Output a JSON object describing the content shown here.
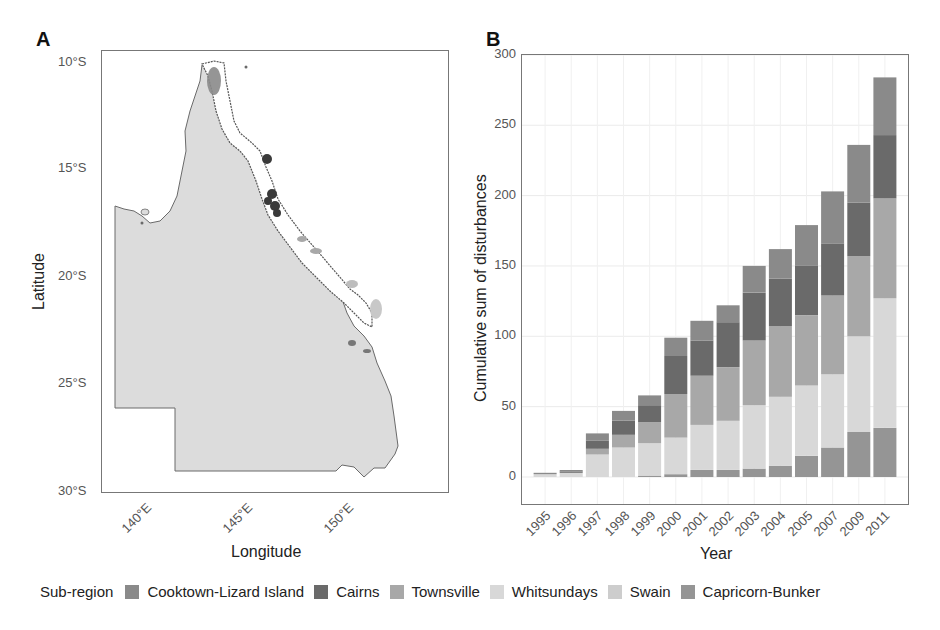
{
  "panels": {
    "a": {
      "label": "A",
      "xlabel": "Longitude",
      "ylabel": "Latitude",
      "yticks": [
        "10°S",
        "15°S",
        "20°S",
        "25°S",
        "30°S"
      ],
      "xticks": [
        "140°E",
        "145°E",
        "150°E"
      ]
    },
    "b": {
      "label": "B"
    }
  },
  "legend": {
    "title": "Sub-region",
    "items": [
      {
        "label": "Cooktown-Lizard Island",
        "color": "#8a8a8a"
      },
      {
        "label": "Cairns",
        "color": "#6a6a6a"
      },
      {
        "label": "Townsville",
        "color": "#a8a8a8"
      },
      {
        "label": "Whitsundays",
        "color": "#d8d8d8"
      },
      {
        "label": "Swain",
        "color": "#cdcdcd"
      },
      {
        "label": "Capricorn-Bunker",
        "color": "#959595"
      }
    ]
  },
  "chart_data": {
    "type": "bar",
    "stacked": true,
    "title": "",
    "xlabel": "Year",
    "ylabel": "Cumulative sum of disturbances",
    "ylim": [
      0,
      300
    ],
    "yticks": [
      0,
      50,
      100,
      150,
      200,
      250,
      300
    ],
    "grid": true,
    "legend_position": "bottom",
    "categories": [
      "1995",
      "1996",
      "1997",
      "1998",
      "1999",
      "2000",
      "2001",
      "2002",
      "2003",
      "2004",
      "2005",
      "2007",
      "2009",
      "2011"
    ],
    "series": [
      {
        "name": "Capricorn-Bunker",
        "color": "#959595",
        "values": [
          0,
          0,
          0,
          0,
          1,
          2,
          5,
          5,
          6,
          8,
          15,
          21,
          32,
          35
        ]
      },
      {
        "name": "Swain",
        "color": "#cdcdcd",
        "values": [
          0,
          0,
          0,
          0,
          0,
          0,
          0,
          0,
          0,
          0,
          0,
          0,
          0,
          0
        ]
      },
      {
        "name": "Whitsundays",
        "color": "#d8d8d8",
        "values": [
          2,
          3,
          16,
          21,
          23,
          26,
          32,
          35,
          45,
          49,
          50,
          52,
          68,
          92
        ]
      },
      {
        "name": "Townsville",
        "color": "#a8a8a8",
        "values": [
          0,
          0,
          4,
          9,
          15,
          31,
          35,
          38,
          46,
          50,
          50,
          56,
          57,
          71
        ]
      },
      {
        "name": "Cairns",
        "color": "#6a6a6a",
        "values": [
          0,
          1,
          6,
          10,
          12,
          27,
          25,
          32,
          34,
          34,
          35,
          37,
          38,
          45
        ]
      },
      {
        "name": "Cooktown-Lizard Island",
        "color": "#8a8a8a",
        "values": [
          1,
          1,
          5,
          7,
          7,
          13,
          14,
          12,
          19,
          21,
          29,
          37,
          41,
          41
        ]
      }
    ]
  }
}
